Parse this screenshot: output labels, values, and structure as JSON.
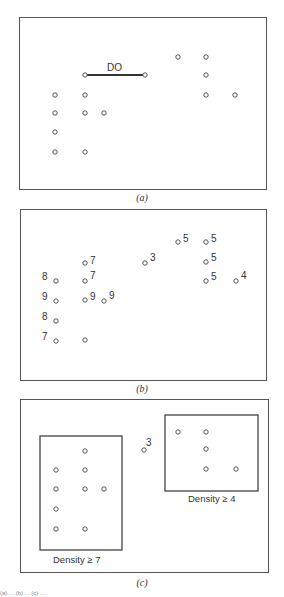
{
  "figure": {
    "captions": {
      "a": "(a)",
      "b": "(b)",
      "c": "(c)"
    },
    "panel_a": {
      "edge_label": "DO",
      "points": [
        {
          "col": 1,
          "row": 0
        },
        {
          "col": 3,
          "row": 0
        },
        {
          "col": 4,
          "row": -1
        },
        {
          "col": 5,
          "row": -1
        },
        {
          "col": 5,
          "row": 0
        },
        {
          "col": 0,
          "row": 1
        },
        {
          "col": 1,
          "row": 1
        },
        {
          "col": 5,
          "row": 1
        },
        {
          "col": 6,
          "row": 1
        },
        {
          "col": 0,
          "row": 2
        },
        {
          "col": 1,
          "row": 2
        },
        {
          "col": 2,
          "row": 2
        },
        {
          "col": 0,
          "row": 3
        },
        {
          "col": 0,
          "row": 4
        },
        {
          "col": 1,
          "row": 4
        }
      ]
    },
    "panel_b": {
      "points": [
        {
          "id": "p1",
          "density": "7"
        },
        {
          "id": "p2",
          "density": "3"
        },
        {
          "id": "p3",
          "density": "5"
        },
        {
          "id": "p4",
          "density": "5"
        },
        {
          "id": "p5",
          "density": "5"
        },
        {
          "id": "p6",
          "density": "8"
        },
        {
          "id": "p7",
          "density": "7"
        },
        {
          "id": "p8",
          "density": "5"
        },
        {
          "id": "p9",
          "density": "4"
        },
        {
          "id": "p10",
          "density": "9"
        },
        {
          "id": "p11",
          "density": "9"
        },
        {
          "id": "p12",
          "density": "9"
        },
        {
          "id": "p13",
          "density": "8"
        },
        {
          "id": "p14",
          "density": "7"
        },
        {
          "id": "p15",
          "density": ""
        }
      ]
    },
    "panel_c": {
      "outlier_label": "3",
      "cluster_left_label": "Density ≥ 7",
      "cluster_right_label": "Density ≥ 4"
    },
    "footnote": "(a) ... (b) ... (c) ..."
  }
}
